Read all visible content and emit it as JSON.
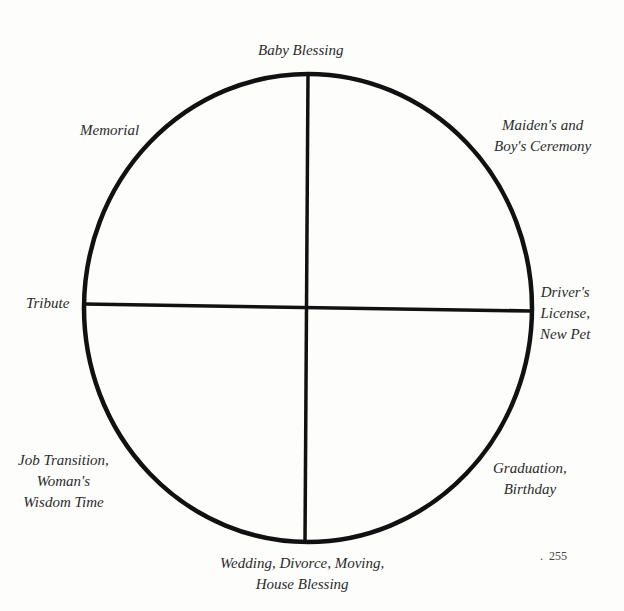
{
  "diagram": {
    "type": "wheel",
    "stroke_color": "#111111",
    "labels": {
      "top": "Baby Blessing",
      "top_right": [
        "Maiden's and",
        "Boy's Ceremony"
      ],
      "right": [
        "Driver's",
        "License,",
        "New Pet"
      ],
      "bottom_right": [
        "Graduation,",
        "Birthday"
      ],
      "bottom": [
        "Wedding, Divorce, Moving,",
        "House Blessing"
      ],
      "bottom_left": [
        "Job Transition,",
        "Woman's",
        "Wisdom Time"
      ],
      "left": "Tribute",
      "top_left": "Memorial"
    }
  },
  "page": {
    "number_prefix": ".",
    "number": "255"
  }
}
